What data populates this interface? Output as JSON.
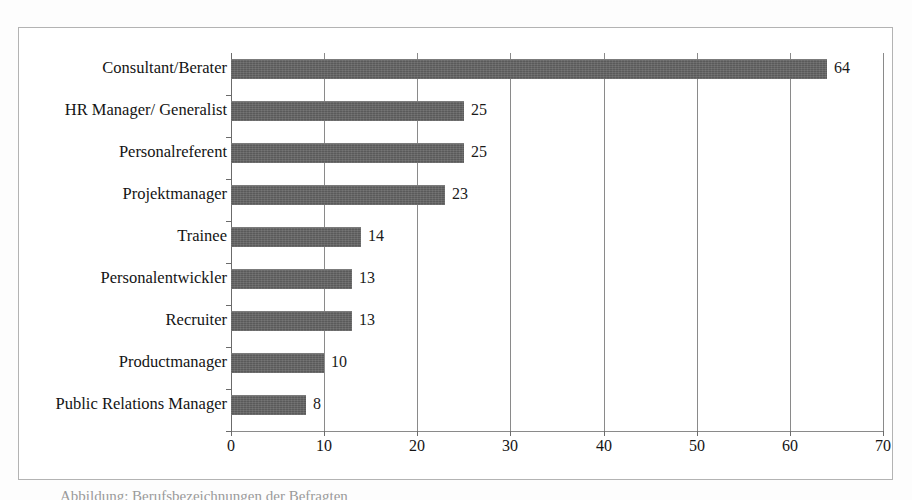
{
  "figure": {
    "background_color": "#fdfdfd",
    "frame_color": "#b3b3b3",
    "bottom_caption": "Abbildung: Berufsbezeichnungen der Befragten"
  },
  "chart_data": {
    "type": "bar",
    "orientation": "horizontal",
    "title": "",
    "subtitle": "",
    "xlabel": "",
    "ylabel": "",
    "categories": [
      "Consultant/Berater",
      "HR Manager/ Generalist",
      "Personalreferent",
      "Projektmanager",
      "Trainee",
      "Personalentwickler",
      "Recruiter",
      "Productmanager",
      "Public Relations Manager"
    ],
    "values": [
      64,
      25,
      25,
      23,
      14,
      13,
      13,
      10,
      8
    ],
    "data_labels": [
      "64",
      "25",
      "25",
      "23",
      "14",
      "13",
      "13",
      "10",
      "8"
    ],
    "xlim": [
      0,
      70
    ],
    "xticks": [
      0,
      10,
      20,
      30,
      40,
      50,
      60,
      70
    ],
    "xtick_labels": [
      "0",
      "10",
      "20",
      "30",
      "40",
      "50",
      "60",
      "70"
    ],
    "grid": "vertical-only",
    "legend": "none",
    "bar_color": "#5a5a5a",
    "gridline_color": "#8a8a8a",
    "axis_color": "#6b6b6b"
  }
}
